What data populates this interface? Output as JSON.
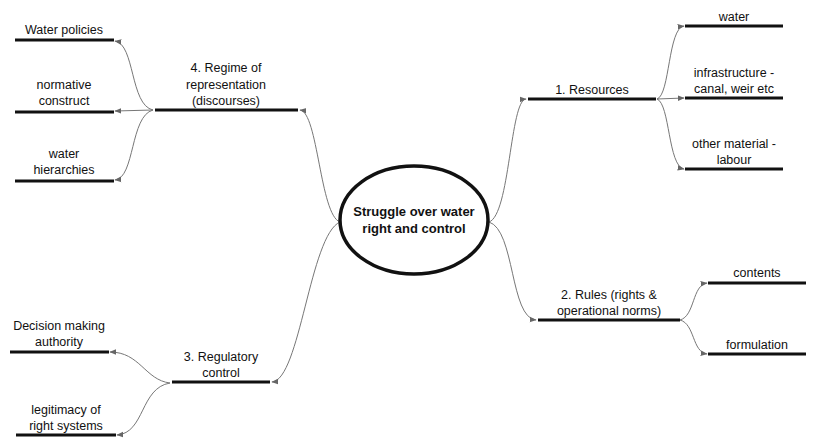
{
  "center": {
    "lines": [
      "Struggle over water",
      "right and control"
    ]
  },
  "branches": [
    {
      "id": "resources",
      "lines": [
        "1. Resources"
      ],
      "children": [
        {
          "lines": [
            "water"
          ]
        },
        {
          "lines": [
            "infrastructure -",
            "canal, weir etc"
          ]
        },
        {
          "lines": [
            "other material -",
            "labour"
          ]
        }
      ]
    },
    {
      "id": "rules",
      "lines": [
        "2. Rules (rights &",
        "operational norms)"
      ],
      "children": [
        {
          "lines": [
            "contents"
          ]
        },
        {
          "lines": [
            "formulation"
          ]
        }
      ]
    },
    {
      "id": "regulatory",
      "lines": [
        "3. Regulatory",
        "control"
      ],
      "children": [
        {
          "lines": [
            "Decision making",
            "authority"
          ]
        },
        {
          "lines": [
            "legitimacy of",
            "right systems"
          ]
        }
      ]
    },
    {
      "id": "representation",
      "lines": [
        "4. Regime of",
        "representation",
        "(discourses)"
      ],
      "children": [
        {
          "lines": [
            "Water policies"
          ]
        },
        {
          "lines": [
            "normative",
            "construct"
          ]
        },
        {
          "lines": [
            "water",
            "hierarchies"
          ]
        }
      ]
    }
  ],
  "colors": {
    "node_line": "#111111",
    "connector": "#777777",
    "arrow": "#666666"
  }
}
